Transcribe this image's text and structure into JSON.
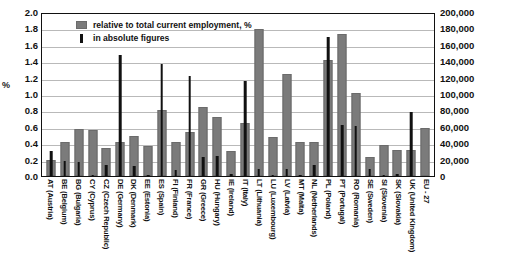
{
  "chart": {
    "y_axis_left_title": "%",
    "legend": [
      {
        "key": "relative",
        "label": "relative to total current employment, %",
        "swatch": "grey-square-swatch",
        "color": "#7b7b7b"
      },
      {
        "key": "absolute",
        "label": "in absolute figures",
        "swatch": "black-bar-swatch",
        "color": "#111111"
      }
    ],
    "y_left_ticks": [
      "2.0",
      "1.8",
      "1.6",
      "1.4",
      "1.2",
      "1.0",
      "0.8",
      "0.6",
      "0.4",
      "0.2",
      "0.0"
    ],
    "y_right_ticks": [
      "200,000",
      "180,000",
      "160,000",
      "140,000",
      "120,000",
      "100,000",
      "80,000",
      "60,000",
      "40,000",
      "20,000",
      "0"
    ]
  },
  "chart_data": {
    "type": "bar",
    "title": "",
    "subtitle": "",
    "xlabel": "",
    "ylabel": "%",
    "ylabel_secondary": "",
    "grid": true,
    "legend_position": "top-left-inside",
    "ylim": [
      0,
      2.0
    ],
    "ylim_secondary": [
      0,
      200000
    ],
    "ytick_step": 0.2,
    "ytick_step_secondary": 20000,
    "categories": [
      "AT (Austria)",
      "BE (Belgium)",
      "BG (Bulgaria)",
      "CY (Cyprus)",
      "CZ (Czech Republic)",
      "DE (Germany)",
      "DK (Denmark)",
      "EE (Estonia)",
      "ES (Spain)",
      "FI (Finland)",
      "FR (France)",
      "GR (Greece)",
      "HU (Hungary)",
      "IE (Ireland)",
      "IT (Italy)",
      "LT (Lithuania)",
      "LU (Luxembourg)",
      "LV (Latvia)",
      "MT (Malta)",
      "NL (Netherlands)",
      "PL (Poland)",
      "PT (Portugal)",
      "RO (Romania)",
      "SE (Sweden)",
      "SI (Slovenia)",
      "SK (Slovakia)",
      "UK (United Kingdom)",
      "EU - 27"
    ],
    "series": [
      {
        "name": "relative to total current employment, %",
        "axis": "left",
        "unit": "%",
        "color": "#7b7b7b",
        "values": [
          0.2,
          0.41,
          0.57,
          0.56,
          0.34,
          0.42,
          0.49,
          0.36,
          0.81,
          0.41,
          0.54,
          0.84,
          0.72,
          0.3,
          0.65,
          1.79,
          0.47,
          1.25,
          0.42,
          0.41,
          1.42,
          1.73,
          1.01,
          0.23,
          0.38,
          0.32,
          0.32,
          0.59
        ]
      },
      {
        "name": "in absolute figures",
        "axis": "right",
        "unit": "persons",
        "color": "#111111",
        "values": [
          30000,
          18000,
          17000,
          1500,
          13000,
          147000,
          12000,
          1500,
          136000,
          7000,
          122000,
          23000,
          24000,
          3000,
          116000,
          9000,
          500,
          8000,
          500,
          13000,
          170000,
          62000,
          61000,
          9000,
          1500,
          2500,
          78000,
          0
        ]
      }
    ]
  }
}
